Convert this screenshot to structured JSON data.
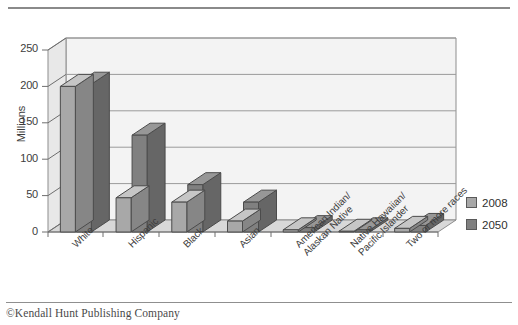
{
  "footer": {
    "credit": "©Kendall Hunt Publishing Company"
  },
  "legend": {
    "position": "right",
    "entries": [
      {
        "label": "2008",
        "color": "#a8a8a8"
      },
      {
        "label": "2050",
        "color": "#808080"
      }
    ]
  },
  "chart_data": {
    "type": "bar",
    "title": "",
    "subtitle": "",
    "xlabel": "",
    "ylabel": "Millions",
    "ylim": [
      0,
      250
    ],
    "yticks": [
      0,
      50,
      100,
      150,
      200,
      250
    ],
    "ytick_labels": [
      "0",
      "50",
      "100",
      "150",
      "200",
      "250"
    ],
    "grid": true,
    "grid_axis": "y",
    "three_d": true,
    "categories": [
      "White",
      "Hispanic",
      "Black",
      "Asian",
      "American Indian/\nAlaskan Native",
      "Native Hawaiian/\nPacific Islander",
      "Two or more races"
    ],
    "category_lines": [
      [
        "White"
      ],
      [
        "Hispanic"
      ],
      [
        "Black"
      ],
      [
        "Asian"
      ],
      [
        "American Indian/",
        "Alaskan Native"
      ],
      [
        "Native Hawaiian/",
        "Pacific Islander"
      ],
      [
        "Two or more races"
      ]
    ],
    "series": [
      {
        "name": "2008",
        "color": "#a8a8a8",
        "values": [
          200,
          47,
          41,
          15,
          3,
          1,
          5
        ]
      },
      {
        "name": "2050",
        "color": "#808080",
        "values": [
          203,
          133,
          65,
          41,
          6,
          3,
          9
        ]
      }
    ]
  }
}
